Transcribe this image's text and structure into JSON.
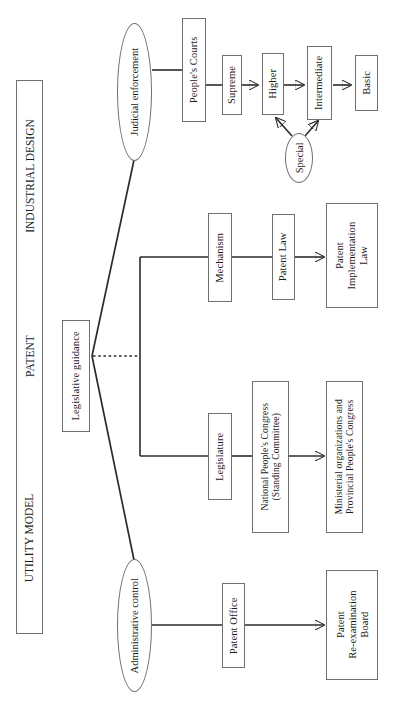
{
  "diagram": {
    "title_categories": [
      {
        "label": "INDUSTRIAL DESIGN"
      },
      {
        "label": "PATENT"
      },
      {
        "label": "UTILITY MODEL"
      }
    ],
    "root": {
      "label": "Legislative guidance"
    },
    "branches": {
      "judicial": {
        "label": "Judicial enforcement",
        "chain": [
          {
            "label": "People's Courts"
          },
          {
            "label": "Supreme"
          },
          {
            "label": "Higher"
          },
          {
            "label": "Intermediate"
          },
          {
            "label": "Basic"
          }
        ],
        "side": {
          "label": "Special"
        }
      },
      "legislative": {
        "mechanism_path": [
          {
            "label": "Mechanism"
          },
          {
            "label": "Patent Law"
          },
          {
            "label": "Patent\nImplementation\nLaw"
          }
        ],
        "legislature_path": [
          {
            "label": "Legislature"
          },
          {
            "label": "National People's Congress\n(Standing Committee)"
          },
          {
            "label": "Ministerial organizations and\nProvincial People's Congress"
          }
        ]
      },
      "administrative": {
        "label": "Administrative control",
        "chain": [
          {
            "label": "Patent Office"
          },
          {
            "label": "Patent\nRe-examination\nBoard"
          }
        ]
      }
    },
    "colors": {
      "stroke": "#2b2b2b",
      "node_border": "#6f6f6f",
      "background": "#ffffff",
      "text": "#1a1a1a"
    }
  }
}
